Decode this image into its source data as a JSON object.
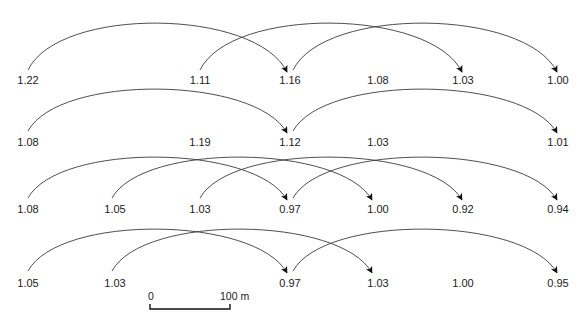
{
  "diagram": {
    "type": "arc-flow",
    "rows": [
      {
        "id": "row-1",
        "label_y": 80,
        "arc_apex_y": 22,
        "arc_base_y": 72,
        "nodes": [
          {
            "x": 28,
            "value": "1.22"
          },
          {
            "x": 200,
            "value": "1.11"
          },
          {
            "x": 290,
            "value": "1.16"
          },
          {
            "x": 378,
            "value": "1.08"
          },
          {
            "x": 463,
            "value": "1.03"
          },
          {
            "x": 558,
            "value": "1.00"
          }
        ],
        "arcs": [
          {
            "from_x": 28,
            "to_x": 287
          },
          {
            "from_x": 200,
            "to_x": 462
          },
          {
            "from_x": 293,
            "to_x": 557
          }
        ]
      },
      {
        "id": "row-2",
        "label_y": 142,
        "arc_apex_y": 88,
        "arc_base_y": 133,
        "nodes": [
          {
            "x": 28,
            "value": "1.08"
          },
          {
            "x": 200,
            "value": "1.19"
          },
          {
            "x": 290,
            "value": "1.12"
          },
          {
            "x": 378,
            "value": "1.03"
          },
          {
            "x": 558,
            "value": "1.01"
          }
        ],
        "arcs": [
          {
            "from_x": 28,
            "to_x": 287
          },
          {
            "from_x": 293,
            "to_x": 557
          }
        ]
      },
      {
        "id": "row-3",
        "label_y": 209,
        "arc_apex_y": 156,
        "arc_base_y": 200,
        "nodes": [
          {
            "x": 28,
            "value": "1.08"
          },
          {
            "x": 115,
            "value": "1.05"
          },
          {
            "x": 200,
            "value": "1.03"
          },
          {
            "x": 290,
            "value": "0.97"
          },
          {
            "x": 378,
            "value": "1.00"
          },
          {
            "x": 463,
            "value": "0.92"
          },
          {
            "x": 558,
            "value": "0.94"
          }
        ],
        "arcs": [
          {
            "from_x": 28,
            "to_x": 287
          },
          {
            "from_x": 112,
            "to_x": 372
          },
          {
            "from_x": 200,
            "to_x": 462
          },
          {
            "from_x": 293,
            "to_x": 557
          }
        ]
      },
      {
        "id": "row-4",
        "label_y": 283,
        "arc_apex_y": 228,
        "arc_base_y": 273,
        "nodes": [
          {
            "x": 28,
            "value": "1.05"
          },
          {
            "x": 115,
            "value": "1.03"
          },
          {
            "x": 290,
            "value": "0.97"
          },
          {
            "x": 378,
            "value": "1.03"
          },
          {
            "x": 463,
            "value": "1.00"
          },
          {
            "x": 558,
            "value": "0.95"
          }
        ],
        "arcs": [
          {
            "from_x": 28,
            "to_x": 287
          },
          {
            "from_x": 112,
            "to_x": 372
          },
          {
            "from_x": 293,
            "to_x": 557
          }
        ]
      }
    ],
    "scale_bar": {
      "start_label": "0",
      "end_label": "100 m",
      "x1": 150,
      "x2": 230,
      "y": 309,
      "label_y": 296
    },
    "colors": {
      "arc": "#3a3a3a",
      "arrowhead": "#111111",
      "text": "#1a1a1a",
      "background": "#ffffff"
    }
  }
}
